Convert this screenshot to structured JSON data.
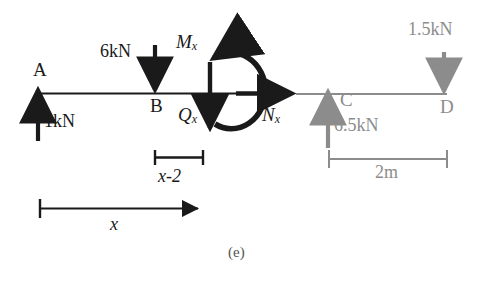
{
  "figure": {
    "caption": "(e)",
    "type": "free-body-diagram",
    "colors": {
      "black": "#1a1a1a",
      "gray": "#8c8c8c"
    }
  },
  "beam": {
    "left_segment_label": "A-B-cut (solid black)",
    "right_segment_label": "cut-C-D (gray)"
  },
  "points": [
    {
      "id": "A",
      "label": "A"
    },
    {
      "id": "B",
      "label": "B"
    },
    {
      "id": "C",
      "label": "C"
    },
    {
      "id": "D",
      "label": "D"
    }
  ],
  "forces": [
    {
      "name": "reaction-at-A",
      "label": "1kN",
      "direction": "up",
      "color": "black"
    },
    {
      "name": "load-at-B",
      "label": "6kN",
      "direction": "down",
      "color": "black"
    },
    {
      "name": "reaction-at-C",
      "label": "6.5kN",
      "direction": "up",
      "color": "gray"
    },
    {
      "name": "load-at-D",
      "label": "1.5kN",
      "direction": "down",
      "color": "gray"
    }
  ],
  "internal_forces": [
    {
      "name": "moment",
      "symbol": "M",
      "subscript": "x",
      "direction": "counterclockwise-arc"
    },
    {
      "name": "shear",
      "symbol": "Q",
      "subscript": "x",
      "direction": "down"
    },
    {
      "name": "axial",
      "symbol": "N",
      "subscript": "x",
      "direction": "right"
    }
  ],
  "dimensions": [
    {
      "name": "x-minus-2",
      "label": "x-2",
      "color": "black"
    },
    {
      "name": "x",
      "label": "x",
      "color": "black"
    },
    {
      "name": "two-meters",
      "label": "2m",
      "color": "gray"
    }
  ]
}
